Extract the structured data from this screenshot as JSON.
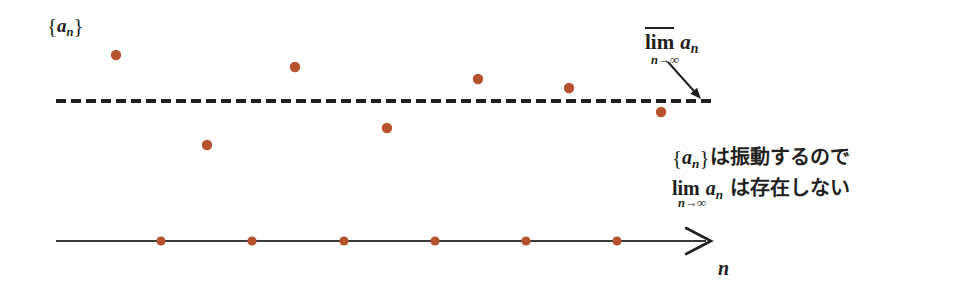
{
  "figure": {
    "background": "#ffffff",
    "width": 953,
    "height": 288
  },
  "labels": {
    "sequence_brace_open": "{",
    "sequence_brace_close": "}",
    "sequence_var": "a",
    "sequence_sub": "n",
    "limsup_op": "lim",
    "limsup_operand_var": "a",
    "limsup_operand_sub": "n",
    "limit_sub_var": "n",
    "limit_sub_arrow": "→",
    "limit_sub_infinity": "∞",
    "axis_label": "n"
  },
  "annotation": {
    "line1_brace_open": "{",
    "line1_var": "a",
    "line1_sub": "n",
    "line1_brace_close": "}",
    "line1_text": "は振動するので",
    "line2_op": "lim",
    "line2_var": "a",
    "line2_sub": "n",
    "line2_text": "は存在しない",
    "line2_sub_var": "n",
    "line2_sub_arrow": "→",
    "line2_sub_infinity": "∞"
  },
  "colors": {
    "point": "#b5532f",
    "point_stroke": "#9c4526",
    "ink": "#231f20",
    "axis": "#3a3a3a",
    "background": "#ffffff"
  },
  "chart_data": {
    "type": "scatter",
    "title": "",
    "xlabel": "n",
    "ylabel": "",
    "grid": false,
    "legend": "none",
    "limsup_line": {
      "label": "limsup a_n",
      "y_pixel": 101,
      "style": "dashed",
      "x_start": 56,
      "x_end": 712,
      "dash": "10 5",
      "width": 4,
      "color": "#231f20"
    },
    "axis": {
      "y_pixel": 241,
      "x_start": 56,
      "x_end": 706,
      "arrowhead": true,
      "color": "#3a3a3a"
    },
    "points": [
      {
        "n": 1,
        "x": 116,
        "y": 55,
        "above_limsup": true
      },
      {
        "n": 2,
        "x": 207,
        "y": 145,
        "above_limsup": false
      },
      {
        "n": 3,
        "x": 295,
        "y": 67,
        "above_limsup": true
      },
      {
        "n": 4,
        "x": 387,
        "y": 128,
        "above_limsup": false
      },
      {
        "n": 5,
        "x": 478,
        "y": 79,
        "above_limsup": true
      },
      {
        "n": 6,
        "x": 569,
        "y": 88,
        "above_limsup": true
      },
      {
        "n": 7,
        "x": 661,
        "y": 112,
        "above_limsup": false
      }
    ],
    "axis_ticks": [
      {
        "n": 1,
        "x": 161
      },
      {
        "n": 2,
        "x": 252
      },
      {
        "n": 3,
        "x": 344
      },
      {
        "n": 4,
        "x": 435
      },
      {
        "n": 5,
        "x": 526
      },
      {
        "n": 6,
        "x": 617
      }
    ],
    "annotation_arrow": {
      "from_x": 668,
      "from_y": 62,
      "to_x": 701,
      "to_y": 99,
      "points_to": "limsup_line"
    },
    "point_radius": 5.2,
    "tick_radius": 4.6
  }
}
